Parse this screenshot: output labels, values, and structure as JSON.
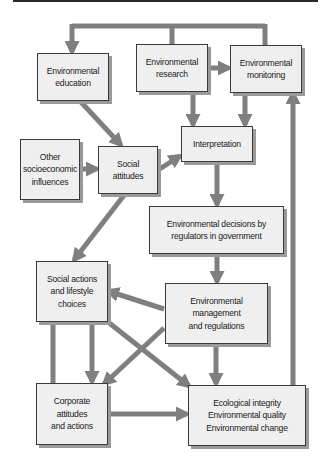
{
  "diagram": {
    "connector_color": "#7f7f7f",
    "box_fill": "#efefef",
    "box_border": "#3a3a3a",
    "box_shadow": "#9a9a9a",
    "nodes": {
      "environmental_education": "Environmental\neducation",
      "environmental_research": "Environmental\nresearch",
      "environmental_monitoring": "Environmental\nmonitoring",
      "other_socioeconomic_influences": "Other\nsocioeconomic\ninfluences",
      "social_attitudes": "Social\nattitudes",
      "interpretation": "Interpretation",
      "environmental_decisions": "Environmental decisions by\nregulators in government",
      "social_actions": "Social actions\nand lifestyle\nchoices",
      "environmental_management": "Environmental\nmanagement\nand regulations",
      "corporate_attitudes": "Corporate\nattitudes\nand actions",
      "ecological_integrity": "Ecological integrity\nEnvironmental quality\nEnvironmental change"
    },
    "edges": [
      {
        "from": "environmental_research",
        "to": "environmental_education"
      },
      {
        "from": "environmental_research",
        "to": "environmental_monitoring"
      },
      {
        "from": "environmental_education",
        "to": "social_attitudes"
      },
      {
        "from": "environmental_research",
        "to": "interpretation"
      },
      {
        "from": "environmental_monitoring",
        "to": "interpretation"
      },
      {
        "from": "other_socioeconomic_influences",
        "to": "social_attitudes"
      },
      {
        "from": "social_attitudes",
        "to": "interpretation"
      },
      {
        "from": "social_attitudes",
        "to": "social_actions"
      },
      {
        "from": "interpretation",
        "to": "environmental_decisions"
      },
      {
        "from": "environmental_decisions",
        "to": "environmental_management"
      },
      {
        "from": "environmental_management",
        "to": "social_actions"
      },
      {
        "from": "social_actions",
        "to": "corporate_attitudes"
      },
      {
        "from": "social_actions",
        "to": "ecological_integrity"
      },
      {
        "from": "environmental_management",
        "to": "corporate_attitudes"
      },
      {
        "from": "environmental_management",
        "to": "ecological_integrity"
      },
      {
        "from": "corporate_attitudes",
        "to": "ecological_integrity"
      },
      {
        "from": "ecological_integrity",
        "to": "environmental_monitoring"
      }
    ]
  }
}
